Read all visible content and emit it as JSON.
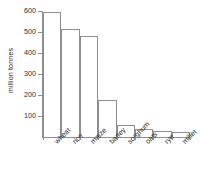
{
  "chart_data": {
    "type": "bar",
    "title": "",
    "subtitle": "",
    "xlabel": "",
    "ylabel": "million tonnes",
    "categories": [
      "wheat",
      "rice",
      "maize",
      "barley",
      "sorghum",
      "oats",
      "rye",
      "millet"
    ],
    "values": [
      595,
      515,
      480,
      178,
      57,
      40,
      30,
      22
    ],
    "ylim": [
      0,
      620
    ],
    "yticks": [
      100,
      200,
      300,
      400,
      500,
      600
    ],
    "ytick_labels": [
      "100",
      "200",
      "300",
      "400",
      "500",
      "600"
    ],
    "grid": false,
    "legend": null,
    "annotations": [],
    "bar_color": "#ffffff",
    "bar_edge_color": "#8e8e8e",
    "axis_color": "#8e8e8e",
    "text_color": "#2b2b2b"
  }
}
